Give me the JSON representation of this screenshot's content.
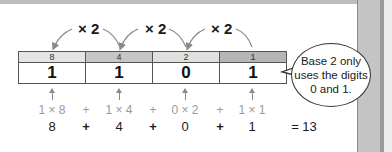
{
  "diagram": {
    "multipliers": [
      "× 2",
      "× 2",
      "× 2"
    ],
    "place_values": [
      "8",
      "4",
      "2",
      "1"
    ],
    "digits": [
      "1",
      "1",
      "0",
      "1"
    ],
    "header_colors": [
      "#e4e4e4",
      "#c6c6c6",
      "#e0e0e0",
      "#b5b5b5"
    ],
    "expansion": [
      "1 × 8",
      "+",
      "1 × 4",
      "+",
      "0 × 2",
      "+",
      "1 × 1"
    ],
    "products": [
      "8",
      "+",
      "4",
      "+",
      "0",
      "+",
      "1"
    ],
    "result": "= 13",
    "callout": {
      "line1": "Base 2 only",
      "line2": "uses the digits",
      "line3": "0 and 1."
    }
  }
}
